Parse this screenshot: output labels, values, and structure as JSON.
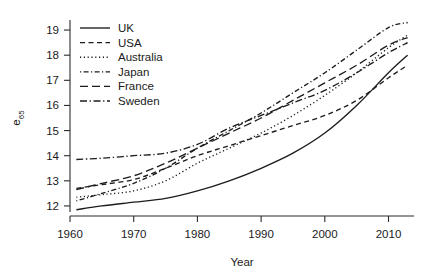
{
  "chart_data": {
    "type": "line",
    "title": "",
    "xlabel": "Year",
    "ylabel": "e65",
    "ylabel_base": "e",
    "ylabel_sub": "65",
    "xlim": [
      1960,
      2014
    ],
    "ylim": [
      11.6,
      19.4
    ],
    "xticks": [
      1960,
      1970,
      1980,
      1990,
      2000,
      2010
    ],
    "yticks": [
      12,
      13,
      14,
      15,
      16,
      17,
      18,
      19
    ],
    "grid": false,
    "legend_position": "top-left",
    "x": [
      1961,
      1965,
      1970,
      1975,
      1980,
      1985,
      1990,
      1995,
      2000,
      2005,
      2010,
      2013
    ],
    "series": [
      {
        "name": "UK",
        "dash": "none",
        "values": [
          11.85,
          12.0,
          12.15,
          12.3,
          12.6,
          13.0,
          13.5,
          14.1,
          14.9,
          16.0,
          17.3,
          18.0
        ]
      },
      {
        "name": "USA",
        "dash": "dashed",
        "values": [
          12.7,
          12.85,
          13.05,
          13.5,
          14.0,
          14.4,
          14.8,
          15.2,
          15.6,
          16.2,
          17.1,
          17.6
        ]
      },
      {
        "name": "Australia",
        "dash": "dotted",
        "values": [
          12.35,
          12.45,
          12.6,
          13.0,
          13.7,
          14.3,
          14.9,
          15.6,
          16.4,
          17.3,
          18.3,
          18.8
        ]
      },
      {
        "name": "Japan",
        "dash": "dashdot-fine",
        "values": [
          12.2,
          12.5,
          12.9,
          13.5,
          14.3,
          15.0,
          15.7,
          16.5,
          17.3,
          18.2,
          19.1,
          19.3
        ]
      },
      {
        "name": "France",
        "dash": "longdash",
        "values": [
          12.65,
          12.9,
          13.2,
          13.7,
          14.3,
          14.9,
          15.5,
          16.2,
          16.9,
          17.6,
          18.4,
          18.7
        ]
      },
      {
        "name": "Sweden",
        "dash": "dashdot",
        "values": [
          13.85,
          13.9,
          14.0,
          14.1,
          14.45,
          15.1,
          15.6,
          16.1,
          16.6,
          17.3,
          18.1,
          18.5
        ]
      }
    ]
  },
  "legend": {
    "items": [
      {
        "label": "UK"
      },
      {
        "label": "USA"
      },
      {
        "label": "Australia"
      },
      {
        "label": "Japan"
      },
      {
        "label": "France"
      },
      {
        "label": "Sweden"
      }
    ]
  },
  "axes": {
    "x_tick_labels": [
      "1960",
      "1970",
      "1980",
      "1990",
      "2000",
      "2010"
    ],
    "y_tick_labels": [
      "12",
      "13",
      "14",
      "15",
      "16",
      "17",
      "18",
      "19"
    ],
    "x_title": "Year",
    "y_title_base": "e",
    "y_title_sub": "65"
  }
}
